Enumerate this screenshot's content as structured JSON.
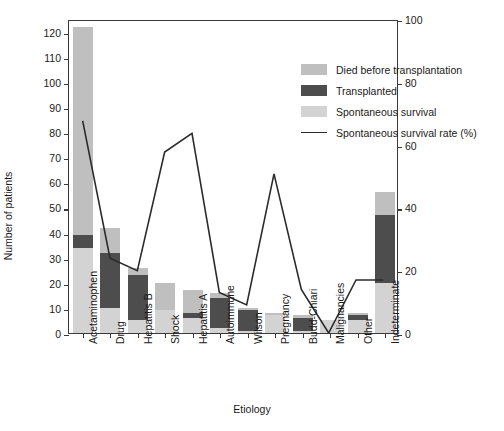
{
  "chart_data": {
    "type": "bar",
    "title": "",
    "xlabel": "Etiology",
    "ylabel": "Number of patients",
    "ylabel_right": "Spontaneous survival (%)",
    "ylim": [
      0,
      125
    ],
    "ylim_right": [
      0,
      100
    ],
    "yticks": [
      0,
      10,
      20,
      30,
      40,
      50,
      60,
      70,
      80,
      90,
      100,
      110,
      120
    ],
    "yticks_right": [
      0,
      20,
      40,
      60,
      80,
      100
    ],
    "grid": false,
    "legend_position": "top-center-right",
    "stacked": true,
    "categories": [
      "Acetaminophen",
      "Drug",
      "Hepatitis B",
      "Shock",
      "Hepatitis A",
      "Autoimmune",
      "Wilson",
      "Pregnancy",
      "Budd-Chiari",
      "Malignancies",
      "Other",
      "Indeterminate"
    ],
    "series": [
      {
        "name": "Spontaneous survival",
        "color": "#d3d3d3",
        "values": [
          34,
          10,
          5,
          9,
          6,
          2,
          1,
          7,
          1,
          5,
          5,
          20
        ]
      },
      {
        "name": "Transplanted",
        "color": "#4d4d4d",
        "values": [
          5,
          22,
          18,
          0,
          2,
          12,
          8,
          0,
          5,
          0,
          2,
          27
        ]
      },
      {
        "name": "Died before transplantation",
        "color": "#bfbfbf",
        "values": [
          83,
          10,
          3,
          11,
          9,
          2,
          1,
          1,
          1,
          0,
          1,
          9
        ]
      }
    ],
    "line_series": {
      "name": "Spontaneous survival rate (%)",
      "color": "#2b2b2b",
      "axis": "right",
      "values": [
        68,
        24,
        20,
        58,
        64,
        13,
        9,
        51,
        14,
        0,
        17,
        17
      ]
    },
    "legend": [
      {
        "label": "Died before transplantation",
        "type": "swatch",
        "color": "#bfbfbf"
      },
      {
        "label": "Transplanted",
        "type": "swatch",
        "color": "#4d4d4d"
      },
      {
        "label": "Spontaneous survival",
        "type": "swatch",
        "color": "#d3d3d3"
      },
      {
        "label": "Spontaneous survival rate (%)",
        "type": "line",
        "color": "#2b2b2b"
      }
    ]
  }
}
